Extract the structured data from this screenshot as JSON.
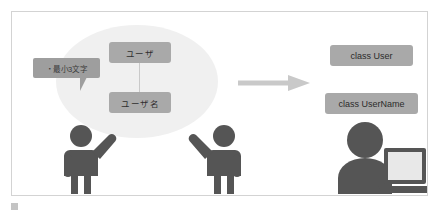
{
  "figure": {
    "caption": "",
    "caption_marker_icon": "square-marker-icon"
  },
  "domain_model": {
    "ellipse_label": "domain-model-area",
    "concepts": [
      {
        "id": "user",
        "label": "ユーザ"
      },
      {
        "id": "username",
        "label": "ユーザ名"
      }
    ],
    "connector": "vertical-link",
    "constraint_callout": {
      "text": "・最小3文字",
      "points_to": "ユーザ名"
    }
  },
  "transform": {
    "arrow_icon": "right-arrow-icon",
    "direction": "right"
  },
  "implementation": {
    "classes": [
      {
        "id": "user",
        "label": "class User"
      },
      {
        "id": "username",
        "label": "class UserName"
      }
    ]
  },
  "actors": [
    {
      "id": "person-left",
      "icon": "person-raising-hand-icon",
      "role": "domain-expert"
    },
    {
      "id": "person-right",
      "icon": "person-raising-hand-icon",
      "role": "domain-expert"
    },
    {
      "id": "developer",
      "icon": "person-with-laptop-icon",
      "role": "developer"
    }
  ],
  "colors": {
    "box_gray": "#a9a9a9",
    "callout_gray": "#9e9e9e",
    "ellipse_gray": "#f0f0f0",
    "figure_gray": "#555555",
    "arrow_gray": "#c9c9c9",
    "frame_border": "#d3d3d3"
  }
}
